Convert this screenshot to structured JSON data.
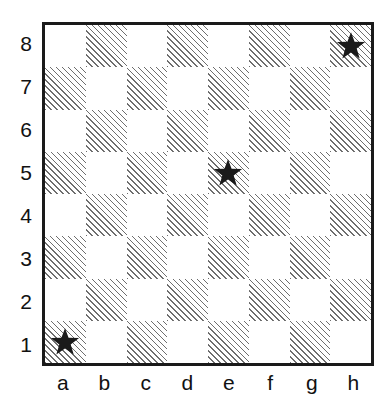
{
  "board": {
    "title": "Chessboard diagram",
    "files": [
      "a",
      "b",
      "c",
      "d",
      "e",
      "f",
      "g",
      "h"
    ],
    "ranks": [
      "8",
      "7",
      "6",
      "5",
      "4",
      "3",
      "2",
      "1"
    ],
    "size": 8,
    "colors": {
      "light_square": "#ffffff",
      "dark_square_hatch": "#6e6e6e",
      "border": "#1a1a1a",
      "marker": "#1a1a1a",
      "label_text": "#111111"
    },
    "dark_square_style": "diagonal-hatch-45",
    "marker_icon": "star-icon",
    "markers": [
      "a1",
      "e5",
      "h8"
    ],
    "squares": [
      [
        {
          "id": "a8",
          "shade": "light",
          "marker": null
        },
        {
          "id": "b8",
          "shade": "dark",
          "marker": null
        },
        {
          "id": "c8",
          "shade": "light",
          "marker": null
        },
        {
          "id": "d8",
          "shade": "dark",
          "marker": null
        },
        {
          "id": "e8",
          "shade": "light",
          "marker": null
        },
        {
          "id": "f8",
          "shade": "dark",
          "marker": null
        },
        {
          "id": "g8",
          "shade": "light",
          "marker": null
        },
        {
          "id": "h8",
          "shade": "dark",
          "marker": "star"
        }
      ],
      [
        {
          "id": "a7",
          "shade": "dark",
          "marker": null
        },
        {
          "id": "b7",
          "shade": "light",
          "marker": null
        },
        {
          "id": "c7",
          "shade": "dark",
          "marker": null
        },
        {
          "id": "d7",
          "shade": "light",
          "marker": null
        },
        {
          "id": "e7",
          "shade": "dark",
          "marker": null
        },
        {
          "id": "f7",
          "shade": "light",
          "marker": null
        },
        {
          "id": "g7",
          "shade": "dark",
          "marker": null
        },
        {
          "id": "h7",
          "shade": "light",
          "marker": null
        }
      ],
      [
        {
          "id": "a6",
          "shade": "light",
          "marker": null
        },
        {
          "id": "b6",
          "shade": "dark",
          "marker": null
        },
        {
          "id": "c6",
          "shade": "light",
          "marker": null
        },
        {
          "id": "d6",
          "shade": "dark",
          "marker": null
        },
        {
          "id": "e6",
          "shade": "light",
          "marker": null
        },
        {
          "id": "f6",
          "shade": "dark",
          "marker": null
        },
        {
          "id": "g6",
          "shade": "light",
          "marker": null
        },
        {
          "id": "h6",
          "shade": "dark",
          "marker": null
        }
      ],
      [
        {
          "id": "a5",
          "shade": "dark",
          "marker": null
        },
        {
          "id": "b5",
          "shade": "light",
          "marker": null
        },
        {
          "id": "c5",
          "shade": "dark",
          "marker": null
        },
        {
          "id": "d5",
          "shade": "light",
          "marker": null
        },
        {
          "id": "e5",
          "shade": "dark",
          "marker": "star"
        },
        {
          "id": "f5",
          "shade": "light",
          "marker": null
        },
        {
          "id": "g5",
          "shade": "dark",
          "marker": null
        },
        {
          "id": "h5",
          "shade": "light",
          "marker": null
        }
      ],
      [
        {
          "id": "a4",
          "shade": "light",
          "marker": null
        },
        {
          "id": "b4",
          "shade": "dark",
          "marker": null
        },
        {
          "id": "c4",
          "shade": "light",
          "marker": null
        },
        {
          "id": "d4",
          "shade": "dark",
          "marker": null
        },
        {
          "id": "e4",
          "shade": "light",
          "marker": null
        },
        {
          "id": "f4",
          "shade": "dark",
          "marker": null
        },
        {
          "id": "g4",
          "shade": "light",
          "marker": null
        },
        {
          "id": "h4",
          "shade": "dark",
          "marker": null
        }
      ],
      [
        {
          "id": "a3",
          "shade": "dark",
          "marker": null
        },
        {
          "id": "b3",
          "shade": "light",
          "marker": null
        },
        {
          "id": "c3",
          "shade": "dark",
          "marker": null
        },
        {
          "id": "d3",
          "shade": "light",
          "marker": null
        },
        {
          "id": "e3",
          "shade": "dark",
          "marker": null
        },
        {
          "id": "f3",
          "shade": "light",
          "marker": null
        },
        {
          "id": "g3",
          "shade": "dark",
          "marker": null
        },
        {
          "id": "h3",
          "shade": "light",
          "marker": null
        }
      ],
      [
        {
          "id": "a2",
          "shade": "light",
          "marker": null
        },
        {
          "id": "b2",
          "shade": "dark",
          "marker": null
        },
        {
          "id": "c2",
          "shade": "light",
          "marker": null
        },
        {
          "id": "d2",
          "shade": "dark",
          "marker": null
        },
        {
          "id": "e2",
          "shade": "light",
          "marker": null
        },
        {
          "id": "f2",
          "shade": "dark",
          "marker": null
        },
        {
          "id": "g2",
          "shade": "light",
          "marker": null
        },
        {
          "id": "h2",
          "shade": "dark",
          "marker": null
        }
      ],
      [
        {
          "id": "a1",
          "shade": "dark",
          "marker": "star"
        },
        {
          "id": "b1",
          "shade": "light",
          "marker": null
        },
        {
          "id": "c1",
          "shade": "dark",
          "marker": null
        },
        {
          "id": "d1",
          "shade": "light",
          "marker": null
        },
        {
          "id": "e1",
          "shade": "dark",
          "marker": null
        },
        {
          "id": "f1",
          "shade": "light",
          "marker": null
        },
        {
          "id": "g1",
          "shade": "dark",
          "marker": null
        },
        {
          "id": "h1",
          "shade": "light",
          "marker": null
        }
      ]
    ]
  }
}
